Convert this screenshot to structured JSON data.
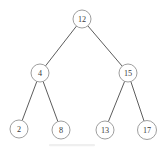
{
  "figure": {
    "background_color": "#ffffff",
    "node_fill": "#ffffff",
    "node_stroke": "#8c8c8c",
    "edge_color": "#4a4a4a",
    "text_color": "#3a3a3a"
  },
  "chart_data": {
    "type": "diagram",
    "diagram_kind": "binary-search-tree",
    "title": "",
    "nodes": [
      {
        "id": "n12",
        "label": "12",
        "cx": 82,
        "cy": 19,
        "r": 9,
        "level": 0,
        "role": "root"
      },
      {
        "id": "n4",
        "label": "4",
        "cx": 40,
        "cy": 73,
        "r": 9,
        "level": 1,
        "role": "internal"
      },
      {
        "id": "n15",
        "label": "15",
        "cx": 128,
        "cy": 73,
        "r": 9,
        "level": 1,
        "role": "internal"
      },
      {
        "id": "n2",
        "label": "2",
        "cx": 19,
        "cy": 129,
        "r": 9,
        "level": 2,
        "role": "leaf"
      },
      {
        "id": "n8",
        "label": "8",
        "cx": 61,
        "cy": 130,
        "r": 9,
        "level": 2,
        "role": "leaf"
      },
      {
        "id": "n13",
        "label": "13",
        "cx": 105,
        "cy": 130,
        "r": 9,
        "level": 2,
        "role": "leaf"
      },
      {
        "id": "n17",
        "label": "17",
        "cx": 147,
        "cy": 130,
        "r": 9.5,
        "level": 2,
        "role": "leaf"
      }
    ],
    "edges": [
      {
        "id": "e-12-4",
        "from": "n12",
        "to": "n4",
        "side": "left"
      },
      {
        "id": "e-12-15",
        "from": "n12",
        "to": "n15",
        "side": "right"
      },
      {
        "id": "e-4-2",
        "from": "n4",
        "to": "n2",
        "side": "left"
      },
      {
        "id": "e-4-8",
        "from": "n4",
        "to": "n8",
        "side": "right"
      },
      {
        "id": "e-15-13",
        "from": "n15",
        "to": "n13",
        "side": "left"
      },
      {
        "id": "e-15-17",
        "from": "n15",
        "to": "n17",
        "side": "right"
      }
    ]
  }
}
